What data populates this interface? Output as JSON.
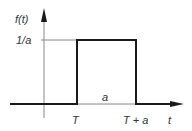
{
  "diagram": {
    "type": "rectangular-pulse",
    "y_axis_label": "f(t)",
    "x_axis_label": "t",
    "level_label": "1/a",
    "width_label": "a",
    "start_label": "T",
    "end_label": "T + a",
    "colors": {
      "signal": "#1a1a1a",
      "axis": "#777777",
      "text": "#333333"
    }
  }
}
